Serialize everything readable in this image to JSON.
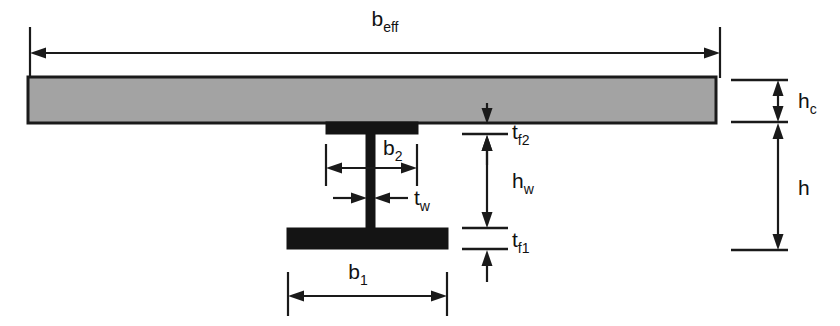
{
  "figure": {
    "type": "engineering-cross-section",
    "background_color": "#ffffff",
    "line_color": "#1a1a1a",
    "canvas": {
      "width": 840,
      "height": 326
    }
  },
  "parts": [
    {
      "id": "concrete-slab",
      "name": "concrete-slab",
      "fill_color": "#a3a3a3",
      "stroke_color": "#1a1a1a",
      "x": 28,
      "y": 77,
      "width": 688,
      "height": 46
    },
    {
      "id": "steel-top-flange",
      "name": "steel-top-flange",
      "fill_color": "#141414",
      "stroke_color": "#141414",
      "x": 326,
      "y": 123,
      "width": 92,
      "height": 11
    },
    {
      "id": "steel-web",
      "name": "steel-web",
      "fill_color": "#141414",
      "stroke_color": "#141414",
      "x": 366,
      "y": 134,
      "width": 9,
      "height": 94
    },
    {
      "id": "steel-bottom-flange",
      "name": "steel-bottom-flange",
      "fill_color": "#141414",
      "stroke_color": "#141414",
      "x": 287,
      "y": 228,
      "width": 161,
      "height": 21
    }
  ],
  "dimensions": {
    "b_eff": {
      "label": "b",
      "subscript": "eff",
      "description": "effective width of concrete slab",
      "orientation": "horizontal",
      "from": 30,
      "to": 720,
      "axis_position": 53,
      "label_x": 385,
      "label_y": 26
    },
    "b_1": {
      "label": "b",
      "subscript": "1",
      "description": "width of steel bottom flange",
      "orientation": "horizontal",
      "from": 288,
      "to": 447,
      "axis_position": 296,
      "label_x": 358,
      "label_y": 279
    },
    "b_2": {
      "label": "b",
      "subscript": "2",
      "description": "width of steel top flange",
      "orientation": "horizontal",
      "from": 326,
      "to": 417,
      "axis_position": 168,
      "label_x": 390,
      "label_y": 155
    },
    "t_w": {
      "label": "t",
      "subscript": "w",
      "description": "thickness of steel web",
      "orientation": "horizontal-outward",
      "from": 366,
      "to": 375,
      "axis_position": 198,
      "label_x": 415,
      "label_y": 205
    },
    "t_f2": {
      "label": "t",
      "subscript": "f2",
      "description": "thickness of steel top flange",
      "orientation": "vertical-outward",
      "from": 123,
      "to": 134,
      "axis_position": 487,
      "label_x": 508,
      "label_y": 139
    },
    "t_f1": {
      "label": "t",
      "subscript": "f1",
      "description": "thickness of steel bottom flange",
      "orientation": "vertical-outward",
      "from": 228,
      "to": 249,
      "axis_position": 487,
      "label_x": 508,
      "label_y": 247
    },
    "h_w": {
      "label": "h",
      "subscript": "w",
      "description": "height of steel web",
      "orientation": "vertical",
      "from": 134,
      "to": 228,
      "axis_position": 487,
      "label_x": 508,
      "label_y": 188
    },
    "h_c": {
      "label": "h",
      "subscript": "c",
      "description": "thickness of concrete slab",
      "orientation": "vertical",
      "from": 80,
      "to": 122,
      "axis_position": 778,
      "label_x": 798,
      "label_y": 108
    },
    "h": {
      "label": "h",
      "subscript": "",
      "description": "overall height of steel section",
      "orientation": "vertical",
      "from": 124,
      "to": 250,
      "axis_position": 778,
      "label_x": 798,
      "label_y": 195
    }
  }
}
